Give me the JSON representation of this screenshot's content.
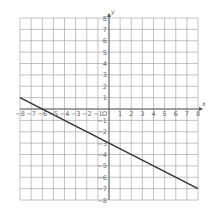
{
  "chart_data": {
    "type": "line",
    "title": "",
    "xlabel": "x",
    "ylabel": "y",
    "xlim": [
      -8,
      8
    ],
    "ylim": [
      -8,
      8
    ],
    "grid": true,
    "origin_label": "O",
    "x_ticks": [
      -8,
      -7,
      -6,
      -5,
      -4,
      -3,
      -2,
      -1,
      1,
      2,
      3,
      4,
      5,
      6,
      7,
      8
    ],
    "y_ticks": [
      8,
      7,
      6,
      5,
      4,
      3,
      2,
      1,
      -1,
      -2,
      -3,
      -4,
      -5,
      -6,
      -7,
      -8
    ],
    "series": [
      {
        "name": "line",
        "x": [
          -8,
          8
        ],
        "y": [
          1,
          -7
        ],
        "slope": -0.5,
        "y_intercept": -3,
        "x_intercept": -6
      }
    ]
  }
}
